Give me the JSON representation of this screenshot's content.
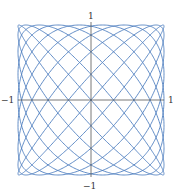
{
  "chart_data": {
    "type": "line",
    "title": "",
    "xlabel": "",
    "ylabel": "",
    "xlim": [
      -1,
      1
    ],
    "ylim": [
      -1,
      1
    ],
    "grid": false,
    "legend": null,
    "curve": {
      "kind": "parametric-lissajous",
      "x_expr": "sin(a*t)",
      "y_expr": "sin(b*t + phase)",
      "a": 9,
      "b": 10,
      "phase": 0.0,
      "t_range": [
        0,
        6.283185307
      ],
      "samples": 3000,
      "color": "#4f7fbf"
    },
    "axes": {
      "color": "#555555",
      "x_tick_labels": [
        "−1",
        "1"
      ],
      "y_tick_labels": [
        "−1",
        "1"
      ]
    }
  },
  "labels": {
    "top": "1",
    "bottom": "−1",
    "left": "−1",
    "right": "1"
  }
}
